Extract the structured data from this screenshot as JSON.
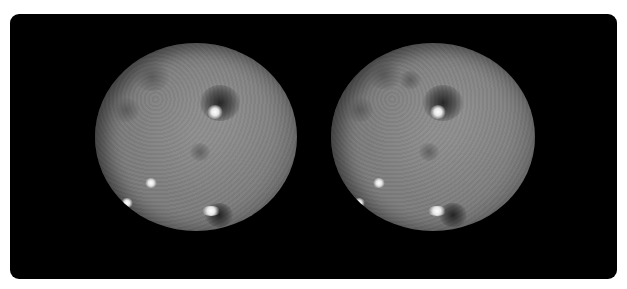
{
  "image": {
    "description": "Stereo pair of the dwarf planet Ceres shown as two grayscale views side by side on a black rounded panel",
    "colors": {
      "page_background": "#ffffff",
      "panel_background": "#000000",
      "surface_gray": "#7d7d7d",
      "bright_spot": "#ffffff"
    },
    "views": [
      {
        "name": "left",
        "features": {
          "bright_spots": [
            [
              119,
              69
            ],
            [
              55,
              140
            ],
            [
              32,
              160
            ],
            [
              117,
              168
            ]
          ],
          "dark_patches": [
            [
              123,
              58
            ],
            [
              116,
              172
            ]
          ]
        }
      },
      {
        "name": "right",
        "features": {
          "bright_spots": [
            [
              106,
              69
            ],
            [
              48,
              140
            ],
            [
              27,
              160
            ],
            [
              107,
              168
            ]
          ],
          "dark_patches": [
            [
              110,
              58
            ],
            [
              116,
              172
            ]
          ]
        }
      }
    ]
  }
}
